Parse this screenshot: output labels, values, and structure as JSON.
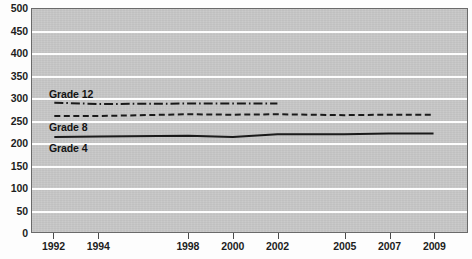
{
  "chart_data": {
    "type": "line",
    "title": "",
    "subtitle": "",
    "xlabel": "",
    "ylabel": "",
    "xlim": [
      1991,
      2010.5
    ],
    "ylim": [
      0,
      500
    ],
    "ytick_step": 50,
    "grid": true,
    "grid_axis": "y",
    "legend": "inline-labels",
    "legend_position": "left-inline",
    "plot_background": "#c7c7c7",
    "gridline_color": "#fdfdfd",
    "line_color": "#1a1a1a",
    "x_tick_labels": [
      "1992",
      "1994",
      "1998",
      "2000",
      "2002",
      "2005",
      "2007",
      "2009"
    ],
    "x_tick_values": [
      1992,
      1994,
      1998,
      2000,
      2002,
      2005,
      2007,
      2009
    ],
    "y_tick_labels": [
      "500",
      "450",
      "400",
      "350",
      "300",
      "250",
      "200",
      "150",
      "100",
      "50",
      "0"
    ],
    "y_tick_values": [
      500,
      450,
      400,
      350,
      300,
      250,
      200,
      150,
      100,
      50,
      0
    ],
    "series": [
      {
        "name": "Grade 12",
        "label": "Grade 12",
        "style": "dash-dot",
        "color": "#1a1a1a",
        "x": [
          1992,
          1994,
          1998,
          2000,
          2002
        ],
        "values": [
          290,
          287,
          288,
          288,
          288
        ]
      },
      {
        "name": "Grade 8",
        "label": "Grade 8",
        "style": "dashed",
        "color": "#1a1a1a",
        "x": [
          1992,
          1994,
          1998,
          2000,
          2002,
          2005,
          2007,
          2009
        ],
        "values": [
          260,
          260,
          264,
          263,
          264,
          262,
          263,
          263
        ]
      },
      {
        "name": "Grade 4",
        "label": "Grade 4",
        "style": "solid",
        "color": "#1a1a1a",
        "x": [
          1992,
          1994,
          1998,
          2000,
          2002,
          2005,
          2007,
          2009
        ],
        "values": [
          213,
          214,
          216,
          213,
          219,
          219,
          221,
          221
        ]
      }
    ],
    "annotations": [
      {
        "text": "Grade 12",
        "x_px": 49,
        "y_px": 88
      },
      {
        "text": "Grade 8",
        "x_px": 49,
        "y_px": 121
      },
      {
        "text": "Grade 4",
        "x_px": 49,
        "y_px": 142
      }
    ]
  }
}
